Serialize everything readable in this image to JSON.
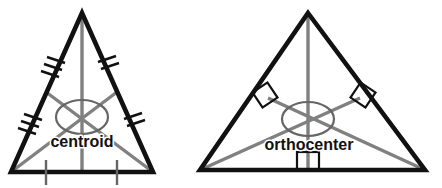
{
  "figure": {
    "title": "",
    "background_color": "#ffffff",
    "outline_color": "#111111",
    "cevian_color": "#808080",
    "marker_color": "#111111",
    "label_color": "#111111"
  },
  "panels": [
    {
      "id": "centroid-panel",
      "label": "centroid",
      "label_position": {
        "x": 82,
        "y": 143
      },
      "concurrency_point_name": "centroid",
      "cevian_type": "median",
      "triangle": {
        "apex": {
          "x": 82,
          "y": 13
        },
        "bottom_left": {
          "x": 11,
          "y": 172
        },
        "bottom_right": {
          "x": 153,
          "y": 172
        }
      },
      "midpoints": {
        "left_side": {
          "x": 46,
          "y": 92
        },
        "right_side": {
          "x": 117,
          "y": 92
        },
        "base": {
          "x": 82,
          "y": 172
        }
      },
      "medians": [
        {
          "from": "apex",
          "to": "base-midpoint"
        },
        {
          "from": "bottom_left",
          "to": "right-side-midpoint"
        },
        {
          "from": "bottom_right",
          "to": "left-side-midpoint"
        }
      ],
      "congruence_ticks": [
        {
          "side": "upper-left",
          "count": 3
        },
        {
          "side": "lower-left",
          "count": 3
        },
        {
          "side": "upper-right",
          "count": 2
        },
        {
          "side": "lower-right",
          "count": 2
        },
        {
          "side": "base-left",
          "count": 1
        },
        {
          "side": "base-right",
          "count": 1
        }
      ],
      "highlight_ellipse": {
        "cx": 82,
        "cy": 117,
        "rx": 26,
        "ry": 17
      }
    },
    {
      "id": "orthocenter-panel",
      "label": "orthocenter",
      "label_position": {
        "x": 309,
        "y": 146
      },
      "concurrency_point_name": "orthocenter",
      "cevian_type": "altitude",
      "triangle": {
        "apex": {
          "x": 308,
          "y": 13
        },
        "bottom_left": {
          "x": 200,
          "y": 170
        },
        "bottom_right": {
          "x": 425,
          "y": 170
        }
      },
      "feet": {
        "left_side": {
          "x": 268,
          "y": 98
        },
        "right_side": {
          "x": 360,
          "y": 98
        },
        "base": {
          "x": 308,
          "y": 170
        }
      },
      "altitudes": [
        {
          "from": "apex",
          "to": "base-foot"
        },
        {
          "from": "bottom_left",
          "to": "right-side-foot"
        },
        {
          "from": "bottom_right",
          "to": "left-side-foot"
        }
      ],
      "right_angle_markers": [
        {
          "at": "left-side-foot",
          "rotated": true,
          "x": 268,
          "y": 98
        },
        {
          "at": "right-side-foot",
          "rotated": true,
          "x": 360,
          "y": 98
        },
        {
          "at": "base-foot",
          "rotated": false,
          "x": 308,
          "y": 170
        }
      ],
      "highlight_ellipse": {
        "cx": 308,
        "cy": 119,
        "rx": 26,
        "ry": 17
      }
    }
  ]
}
